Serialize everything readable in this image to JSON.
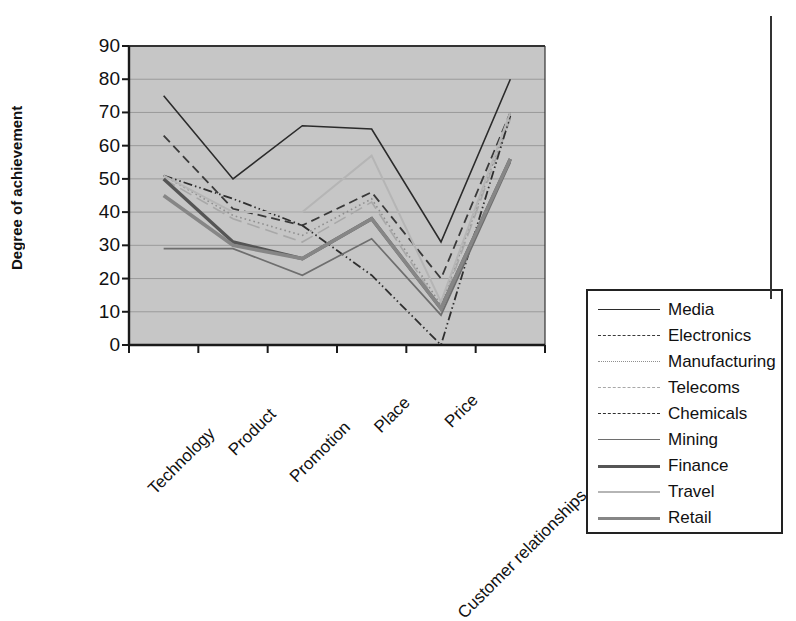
{
  "chart_data": {
    "type": "line",
    "title": "",
    "xlabel": "",
    "ylabel": "Degree of achievement",
    "categories": [
      "Technology",
      "Product",
      "Promotion",
      "Place",
      "Price",
      "Customer relationships"
    ],
    "ylim": [
      0,
      90
    ],
    "yticks": [
      0,
      10,
      20,
      30,
      40,
      50,
      60,
      70,
      80,
      90
    ],
    "grid": true,
    "legend_position": "right",
    "plot_background": "#c6c6c6",
    "series": [
      {
        "name": "Media",
        "values": [
          75,
          50,
          66,
          65,
          31,
          80
        ],
        "color": "#2b2b2b",
        "width": 1.6,
        "dash": "solid"
      },
      {
        "name": "Electronics",
        "values": [
          63,
          41,
          36,
          46,
          20,
          70
        ],
        "color": "#3a3a3a",
        "width": 1.8,
        "dash": "dashed"
      },
      {
        "name": "Manufacturing",
        "values": [
          51,
          39,
          33,
          44,
          12,
          69
        ],
        "color": "#8f8f8f",
        "width": 1.6,
        "dash": "dotted"
      },
      {
        "name": "Telecoms",
        "values": [
          50,
          38,
          31,
          43,
          11,
          68
        ],
        "color": "#a8a8a8",
        "width": 1.6,
        "dash": "longdash"
      },
      {
        "name": "Chemicals",
        "values": [
          51,
          44,
          36,
          21,
          0,
          69
        ],
        "color": "#2f2f2f",
        "width": 1.8,
        "dash": "dashdotdot"
      },
      {
        "name": "Mining",
        "values": [
          29,
          29,
          21,
          32,
          9,
          55
        ],
        "color": "#6e6e6e",
        "width": 1.7,
        "dash": "solid"
      },
      {
        "name": "Finance",
        "values": [
          50,
          31,
          26,
          38,
          11,
          56
        ],
        "color": "#555555",
        "width": 3.4,
        "dash": "solid"
      },
      {
        "name": "Travel",
        "values": [
          51,
          40,
          40,
          57,
          13,
          70
        ],
        "color": "#b5b5b5",
        "width": 2.0,
        "dash": "solid"
      },
      {
        "name": "Retail",
        "values": [
          45,
          30,
          26,
          38,
          11,
          56
        ],
        "color": "#868686",
        "width": 3.6,
        "dash": "solid"
      }
    ]
  }
}
